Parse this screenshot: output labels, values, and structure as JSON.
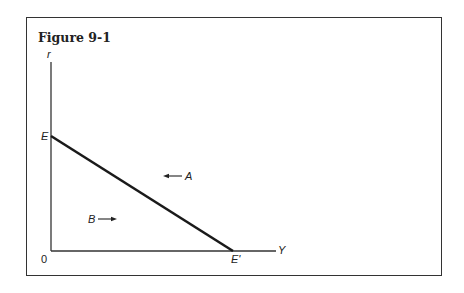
{
  "figure": {
    "title": "Figure 9-1",
    "y_axis_label": "r",
    "x_axis_label": "Y",
    "origin_label": "0",
    "line": {
      "start_label": "E",
      "end_label": "E'"
    },
    "annotations": [
      {
        "label": "A",
        "arrow_direction": "left",
        "region": "above line"
      },
      {
        "label": "B",
        "arrow_direction": "right",
        "region": "below line"
      }
    ]
  },
  "colors": {
    "line": "#1a1a1a",
    "axes": "#333333",
    "frame": "#333333"
  }
}
